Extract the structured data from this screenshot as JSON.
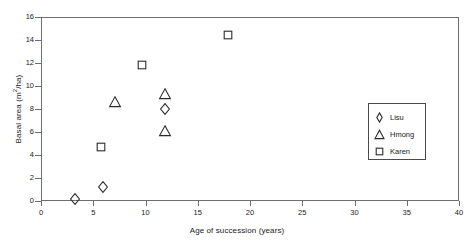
{
  "chart_data": {
    "type": "scatter",
    "title": "",
    "xlabel": "Age of succession (years)",
    "ylabel": "Basal area (m²/ha)",
    "ylabel_base": "Basal area (m",
    "ylabel_exponent": "2",
    "ylabel_tail": "/ha)",
    "xlim": [
      0,
      40
    ],
    "ylim": [
      0,
      16
    ],
    "xticks": [
      0,
      5,
      10,
      15,
      20,
      25,
      30,
      35,
      40
    ],
    "yticks": [
      0,
      2,
      4,
      6,
      8,
      10,
      12,
      14,
      16
    ],
    "xtick_labels": [
      "0",
      "5",
      "10",
      "15",
      "20",
      "25",
      "30",
      "35",
      "40"
    ],
    "ytick_labels": [
      "0",
      "2",
      "4",
      "6",
      "8",
      "10",
      "12",
      "14",
      "16"
    ],
    "grid": false,
    "legend_position": "lower-right",
    "series": [
      {
        "name": "Lisu",
        "marker": "diamond",
        "color": "#2b2b2b",
        "points": [
          {
            "x": 3.3,
            "y": 0.2
          },
          {
            "x": 5.9,
            "y": 1.2
          },
          {
            "x": 11.9,
            "y": 8.0
          }
        ]
      },
      {
        "name": "Hmong",
        "marker": "triangle",
        "color": "#2b2b2b",
        "points": [
          {
            "x": 7.1,
            "y": 8.6
          },
          {
            "x": 11.9,
            "y": 9.3
          },
          {
            "x": 11.9,
            "y": 6.1
          }
        ]
      },
      {
        "name": "Karen",
        "marker": "square",
        "color": "#2b2b2b",
        "points": [
          {
            "x": 5.7,
            "y": 4.7
          },
          {
            "x": 9.7,
            "y": 11.8
          },
          {
            "x": 17.9,
            "y": 14.4
          }
        ]
      }
    ]
  },
  "legend": {
    "items": [
      {
        "label": "Lisu",
        "marker": "diamond"
      },
      {
        "label": "Hmong",
        "marker": "triangle"
      },
      {
        "label": "Karen",
        "marker": "square"
      }
    ]
  }
}
